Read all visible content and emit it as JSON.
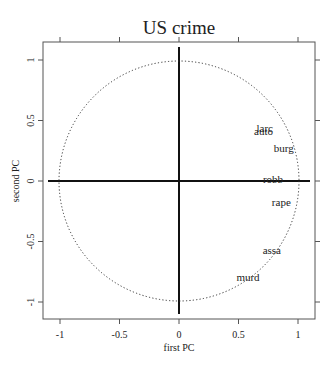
{
  "chart_data": {
    "type": "scatter",
    "title": "US crime",
    "xlabel": "first PC",
    "ylabel": "second PC",
    "xlim": [
      -1.15,
      1.15
    ],
    "ylim": [
      -1.15,
      1.15
    ],
    "x_ticks": [
      -1,
      -0.5,
      0,
      0.5,
      1
    ],
    "x_tick_labels": [
      "-1",
      "-0.5",
      "0",
      "0.5",
      "1"
    ],
    "y_ticks": [
      -1,
      -0.5,
      0,
      0.5,
      1
    ],
    "y_tick_labels": [
      "-1",
      "-0.5",
      "0",
      "0.5",
      "1"
    ],
    "grid": false,
    "legend": "none",
    "unit_circle": {
      "radius": 1,
      "style": "dotted"
    },
    "axes_through_origin": true,
    "points": [
      {
        "label": "larc",
        "x": 0.72,
        "y": 0.44
      },
      {
        "label": "auto",
        "x": 0.71,
        "y": 0.41
      },
      {
        "label": "burg",
        "x": 0.88,
        "y": 0.27
      },
      {
        "label": "robb",
        "x": 0.79,
        "y": 0.02
      },
      {
        "label": "rape",
        "x": 0.86,
        "y": -0.17
      },
      {
        "label": "assa",
        "x": 0.78,
        "y": -0.57
      },
      {
        "label": "murd",
        "x": 0.58,
        "y": -0.79
      }
    ]
  }
}
